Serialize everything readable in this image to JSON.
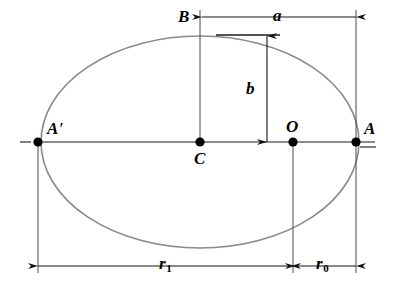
{
  "figure": {
    "type": "geometry-diagram",
    "width": 397,
    "height": 295,
    "background_color": "#ffffff",
    "curve_color": "#808080",
    "line_color": "#1a1a1a",
    "point_color": "#000000"
  },
  "labels": {
    "apoapsis": "A'",
    "center": "C",
    "focus": "O",
    "periapsis": "A",
    "semi_minor_top": "B",
    "semi_major": "a",
    "semi_minor": "b",
    "apoapsis_distance": "r",
    "apoapsis_distance_sub": "1",
    "periapsis_distance": "r",
    "periapsis_distance_sub": "0"
  },
  "geometry": {
    "ellipse": {
      "cx": 200,
      "cy": 142,
      "rx": 159,
      "ry": 106
    },
    "points": [
      {
        "name": "A-prime",
        "x": 38,
        "y": 142
      },
      {
        "name": "C",
        "x": 200,
        "y": 142
      },
      {
        "name": "O",
        "x": 293,
        "y": 142
      },
      {
        "name": "A",
        "x": 356,
        "y": 142
      }
    ],
    "axis_line": {
      "x1": 22,
      "y1": 142,
      "x2": 375,
      "y2": 142
    },
    "dimensions": [
      {
        "name": "a",
        "orientation": "horizontal",
        "x1": 202,
        "x2": 356,
        "y": 17
      },
      {
        "name": "b",
        "orientation": "vertical",
        "x": 267,
        "y1": 35,
        "y2": 142
      },
      {
        "name": "r1",
        "orientation": "horizontal",
        "x1": 38,
        "x2": 293,
        "y": 266
      },
      {
        "name": "r0",
        "orientation": "horizontal",
        "x1": 293,
        "x2": 356,
        "y": 266
      }
    ]
  }
}
